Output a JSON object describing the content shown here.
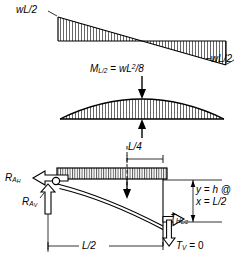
{
  "figure": {
    "type": "structural-engineering-diagram",
    "stroke_color": "#000000",
    "background_color": "#ffffff"
  },
  "shear_diagram": {
    "name": "shear-diagram",
    "left_label": "wL/2",
    "right_label": "−wL/2",
    "left_value_text": "wL/2",
    "right_value_text": "-wL/2",
    "shape": "linear, positive at left support decreasing linearly to negative at right support, zero at midspan",
    "hatching": "vertical line fill"
  },
  "moment_diagram": {
    "name": "moment-diagram",
    "label_prefix": "M",
    "label_subscript": "L/2",
    "label_equals": "=",
    "label_w": "w",
    "label_L": "L",
    "label_exponent": "2",
    "label_denominator": "/8",
    "full_label": "M(L/2) = wL^2/8",
    "shape": "parabolic, maximum at midspan",
    "hatching": "vertical line fill"
  },
  "free_body": {
    "name": "cable-free-body-diagram",
    "load_label": "uniform distributed load on beam",
    "dimension_quarter": "L/4",
    "dimension_half": "L/2",
    "reaction_horizontal": {
      "symbol": "R",
      "subscript": "A",
      "subsubscript": "H",
      "text": "R A_H"
    },
    "reaction_vertical": {
      "symbol": "R",
      "subscript": "A",
      "subsubscript": "V",
      "text": "R A_V"
    },
    "tension_horizontal": {
      "symbol": "T",
      "subscript": "H",
      "subsubscript": "L/2",
      "text": "T H_L/2"
    },
    "tension_vertical": {
      "symbol": "T",
      "subscript": "V",
      "equals": "= 0",
      "text": "T_V = 0"
    },
    "sag_note_line1": "y = h @",
    "sag_note_line2": "x = L/2",
    "sag_y_symbol": "y",
    "sag_h_symbol": "h",
    "sag_at_symbol": "@",
    "sag_x_symbol": "x",
    "sag_x_value": "L/2",
    "cable_shape": "parabolic cable sagging from pin support at left down to midspan where slope is tangent and vertical tension is zero"
  }
}
